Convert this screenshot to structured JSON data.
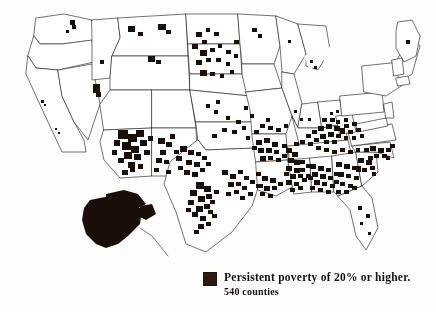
{
  "figure": {
    "title": "Persistent poverty counties of the United States",
    "background_color": "#fdfdfc",
    "ink_color": "#1a0f08",
    "outline_color": "#2a2520"
  },
  "legend": {
    "swatch_color": "#2b1a10",
    "swatch_icon": "filled-square-icon",
    "line_1": "Persistent poverty of 20% or higher.",
    "line_2": "540 counties"
  },
  "chart_data": {
    "type": "map",
    "map_kind": "choropleth",
    "region": "United States",
    "unit": "county",
    "title": "Persistent poverty of 20% or higher.",
    "annotation": "540 counties",
    "legend": [
      {
        "label": "Persistent poverty of 20% or higher.",
        "color": "#2b1a10",
        "count": 540
      }
    ],
    "categories": [
      "Persistent poverty of 20% or higher."
    ],
    "values": [
      540
    ],
    "insets": [
      "Alaska",
      "Hawaii"
    ],
    "grid": false,
    "highlight_clusters": [
      {
        "name": "Mississippi Delta",
        "density": "very high"
      },
      {
        "name": "Alabama Black Belt",
        "density": "very high"
      },
      {
        "name": "Central Appalachia (eastern Kentucky, West Virginia)",
        "density": "very high"
      },
      {
        "name": "Rio Grande Valley / South Texas",
        "density": "very high"
      },
      {
        "name": "Four Corners / Navajo Nation",
        "density": "high"
      },
      {
        "name": "Ozarks (southern Missouri, Arkansas)",
        "density": "high"
      },
      {
        "name": "Carolinas coastal plain",
        "density": "high"
      },
      {
        "name": "Northern Plains reservations (Dakotas, Nebraska, Montana)",
        "density": "moderate"
      },
      {
        "name": "Alaska native villages",
        "density": "high"
      },
      {
        "name": "Northern Great Lakes",
        "density": "low"
      },
      {
        "name": "Florida interior",
        "density": "low"
      },
      {
        "name": "Pacific Coast states",
        "density": "very low"
      },
      {
        "name": "Northeast / Maine",
        "density": "very low"
      }
    ],
    "states_outlined": [
      "Washington",
      "Oregon",
      "California",
      "Nevada",
      "Idaho",
      "Montana",
      "Wyoming",
      "Utah",
      "Arizona",
      "Colorado",
      "New Mexico",
      "North Dakota",
      "South Dakota",
      "Nebraska",
      "Kansas",
      "Oklahoma",
      "Texas",
      "Minnesota",
      "Iowa",
      "Missouri",
      "Arkansas",
      "Louisiana",
      "Wisconsin",
      "Illinois",
      "Michigan",
      "Indiana",
      "Ohio",
      "Kentucky",
      "Tennessee",
      "Mississippi",
      "Alabama",
      "Georgia",
      "Florida",
      "South Carolina",
      "North Carolina",
      "Virginia",
      "West Virginia",
      "Maryland",
      "Delaware",
      "Pennsylvania",
      "New Jersey",
      "New York",
      "Connecticut",
      "Rhode Island",
      "Massachusetts",
      "Vermont",
      "New Hampshire",
      "Maine",
      "Alaska",
      "Hawaii"
    ]
  }
}
